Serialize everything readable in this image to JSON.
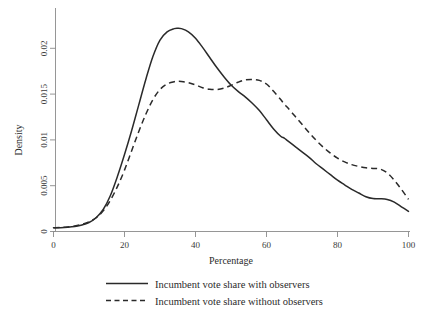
{
  "chart_data": {
    "type": "line",
    "title": "",
    "xlabel": "Percentage",
    "ylabel": "Density",
    "xlim": [
      0,
      100
    ],
    "ylim": [
      0,
      0.0235
    ],
    "grid": false,
    "legend_position": "bottom",
    "xticks": [
      0,
      20,
      40,
      60,
      80,
      100
    ],
    "xtick_labels": [
      "0",
      "20",
      "40",
      "60",
      "80",
      "100"
    ],
    "yticks": [
      0,
      0.005,
      0.01,
      0.015,
      0.02
    ],
    "ytick_labels": [
      "0",
      "0.005",
      "0.01",
      "0.015",
      "0.02"
    ],
    "x": [
      0,
      2,
      4,
      6,
      8,
      10,
      12,
      14,
      16,
      18,
      20,
      22,
      24,
      26,
      28,
      30,
      32,
      34,
      35,
      36,
      38,
      40,
      42,
      44,
      46,
      48,
      50,
      52,
      54,
      56,
      58,
      60,
      62,
      64,
      65,
      66,
      68,
      70,
      72,
      74,
      76,
      78,
      80,
      82,
      84,
      86,
      88,
      90,
      92,
      94,
      96,
      98,
      100
    ],
    "series": [
      {
        "name": "Incumbent vote share with observers",
        "style": "solid",
        "color": "#2a2a2a",
        "values": [
          0.0004,
          0.00042,
          0.00047,
          0.00055,
          0.0007,
          0.00098,
          0.0015,
          0.0024,
          0.0039,
          0.006,
          0.0084,
          0.011,
          0.0138,
          0.0166,
          0.0191,
          0.0209,
          0.0218,
          0.02215,
          0.0222,
          0.02215,
          0.0218,
          0.0211,
          0.0201,
          0.019,
          0.0179,
          0.0169,
          0.016,
          0.0153,
          0.0147,
          0.014,
          0.0132,
          0.0122,
          0.0112,
          0.0104,
          0.0102,
          0.0099,
          0.0093,
          0.0087,
          0.0081,
          0.0074,
          0.0068,
          0.0062,
          0.0056,
          0.0051,
          0.0046,
          0.0042,
          0.0038,
          0.0036,
          0.00358,
          0.0035,
          0.0032,
          0.0027,
          0.0022
        ]
      },
      {
        "name": "Incumbent vote share without observers",
        "style": "dashed",
        "color": "#2a2a2a",
        "values": [
          0.0004,
          0.00043,
          0.0005,
          0.0006,
          0.00078,
          0.00105,
          0.0015,
          0.00225,
          0.0034,
          0.0049,
          0.0067,
          0.0088,
          0.0109,
          0.0128,
          0.0144,
          0.0155,
          0.0161,
          0.01635,
          0.0164,
          0.01638,
          0.01625,
          0.016,
          0.0157,
          0.01553,
          0.0155,
          0.01565,
          0.01595,
          0.0163,
          0.01655,
          0.0166,
          0.0165,
          0.0161,
          0.0153,
          0.0144,
          0.0139,
          0.0135,
          0.0126,
          0.0117,
          0.0108,
          0.00995,
          0.0092,
          0.00855,
          0.008,
          0.0076,
          0.0073,
          0.0071,
          0.00695,
          0.00688,
          0.00682,
          0.0064,
          0.0056,
          0.0046,
          0.0035
        ]
      }
    ]
  },
  "axes": {
    "ylabel": "Density",
    "xlabel": "Percentage"
  },
  "legend": {
    "entries": [
      {
        "label": "Incumbent vote share with observers",
        "style": "solid"
      },
      {
        "label": "Incumbent vote share without observers",
        "style": "dashed"
      }
    ]
  }
}
